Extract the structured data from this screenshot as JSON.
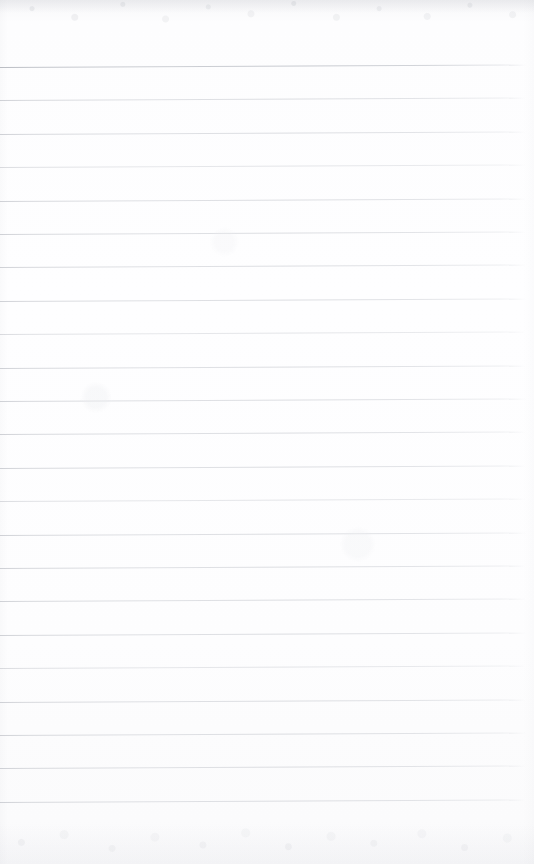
{
  "document": {
    "type": "ruled-notebook-page",
    "title": "Blank Lined Notebook Page",
    "content_text": "",
    "is_blank": true,
    "handwriting_present": false,
    "printed_text_present": false
  },
  "page": {
    "width_px": 534,
    "height_px": 864,
    "paper_color": "#fdfdfe",
    "background_color": "#ffffff",
    "orientation": "portrait",
    "texture": "scanned paper with faint mottling at top and bottom edges"
  },
  "ruling": {
    "style": "horizontal-ruled",
    "line_color": "#d3d5da",
    "first_line_color": "#b9bcc3",
    "line_count": 23,
    "first_line_y_px": 67,
    "line_spacing_px": 33.4,
    "line_thickness_px": 1,
    "line_start_x_px": 0,
    "line_end_x_px": 526,
    "skew_degrees": -0.28,
    "margin_rule_present": false,
    "top_margin_px": 67,
    "bottom_margin_px": 64,
    "right_margin_px": 8,
    "line_y_positions_px": [
      67,
      100.4,
      133.8,
      167.2,
      200.6,
      234,
      267.4,
      300.8,
      334.2,
      367.6,
      401,
      434.4,
      467.8,
      501.2,
      534.6,
      568,
      601.4,
      634.8,
      668.2,
      701.6,
      735,
      768.4,
      801.8
    ]
  }
}
